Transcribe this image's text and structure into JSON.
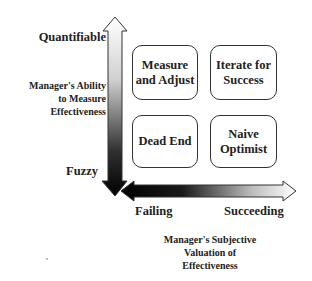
{
  "diagram": {
    "type": "2x2 quadrant matrix",
    "y_axis": {
      "title": "Manager's Ability to Measure Effectiveness",
      "title_lines": [
        "Manager's Ability",
        "to Measure",
        "Effectiveness"
      ],
      "top_label": "Quantifiable",
      "bottom_label": "Fuzzy",
      "gradient": {
        "top": "#ffffff",
        "bottom": "#000000"
      }
    },
    "x_axis": {
      "title": "Manager's Subjective Valuation of Effectiveness",
      "title_lines": [
        "Manager's Subjective",
        "Valuation of",
        "Effectiveness"
      ],
      "left_label": "Failing",
      "right_label": "Succeeding",
      "gradient": {
        "left": "#000000",
        "right": "#ffffff"
      }
    },
    "quadrants": {
      "top_left": {
        "lines": [
          "Measure",
          "and Adjust"
        ]
      },
      "top_right": {
        "lines": [
          "Iterate for",
          "Success"
        ]
      },
      "bottom_left": {
        "lines": [
          "Dead End"
        ]
      },
      "bottom_right": {
        "lines": [
          "Naive",
          "Optimist"
        ]
      }
    }
  }
}
